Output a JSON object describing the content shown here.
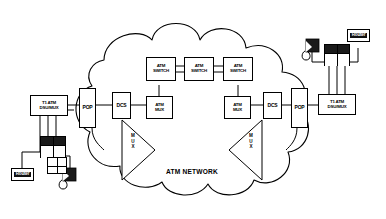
{
  "diagram": {
    "title": "ATM NETWORK",
    "network_label": "ATM NETWORK",
    "cloud_name": "atm-network-cloud",
    "colors": {
      "line": "#000000",
      "background": "#ffffff",
      "device_fill": "#1a1a1a"
    }
  },
  "nodes": {
    "left_dsu": {
      "label": "T1 ATM\nDSU/MUX"
    },
    "left_pop": {
      "label": "POP"
    },
    "left_dcs": {
      "label": "DCS"
    },
    "left_mux_triangle": {
      "label": "M\nU\nX"
    },
    "atm_switch_1": {
      "label": "ATM\nSWITCH"
    },
    "atm_switch_2": {
      "label": "ATM\nSWITCH"
    },
    "atm_switch_3": {
      "label": "ATM\nSWITCH"
    },
    "atm_mux_left": {
      "label": "ATM\nMUX"
    },
    "atm_mux_right": {
      "label": "ATM\nMUX"
    },
    "right_mux_triangle": {
      "label": "M\nU\nX"
    },
    "right_dcs": {
      "label": "DCS"
    },
    "right_pop": {
      "label": "POP"
    },
    "right_dsu": {
      "label": "T1 ATM\nDSU/MUX"
    },
    "router_left": {
      "label": "Router"
    },
    "router_right": {
      "label": "Router"
    },
    "pbx_left": {
      "label": ""
    },
    "pbx_right": {
      "label": ""
    },
    "grid_left": {
      "label": ""
    },
    "phone_left": {
      "label": ""
    },
    "phone_right": {
      "label": ""
    }
  },
  "icons": {
    "phone": "telephone-handset-icon",
    "pbx": "pbx-keysystem-icon",
    "router": "router-icon",
    "cloud": "network-cloud-icon",
    "mux_triangle": "mux-triangle-icon"
  }
}
